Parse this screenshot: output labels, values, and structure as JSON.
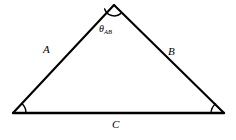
{
  "figure": {
    "name": "triangle-diagram",
    "background_color": "#ffffff",
    "stroke_color": "#000000",
    "width": 236,
    "height": 140,
    "vertices": {
      "apex": {
        "x": 114,
        "y": 5
      },
      "bottom_left": {
        "x": 13,
        "y": 113
      },
      "bottom_right": {
        "x": 224,
        "y": 113
      }
    },
    "sides": [
      {
        "id": "a",
        "label": "A",
        "from": "bottom_left",
        "to": "apex"
      },
      {
        "id": "b",
        "label": "B",
        "from": "apex",
        "to": "bottom_right"
      },
      {
        "id": "c",
        "label": "C",
        "from": "bottom_left",
        "to": "bottom_right"
      }
    ],
    "angles": [
      {
        "id": "apex",
        "label": "θ",
        "subscript": "AB",
        "marker": "arc",
        "radius": 10,
        "at": "apex"
      },
      {
        "id": "bottom-left",
        "label": "",
        "subscript": "",
        "marker": "arc",
        "radius": 13,
        "at": "bottom_left"
      },
      {
        "id": "bottom-right",
        "label": "",
        "subscript": "",
        "marker": "arc",
        "radius": 13,
        "at": "bottom_right"
      }
    ]
  }
}
